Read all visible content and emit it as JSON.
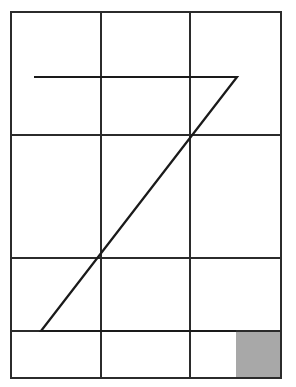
{
  "canvas": {
    "width": 296,
    "height": 387,
    "background_color": "#ffffff",
    "title": "Z-shaped polyline over a rectangular grid with a shaded corner cell"
  },
  "grid": {
    "name": "background-grid",
    "stroke_color": "#2b2b2b",
    "stroke_width": 1.6,
    "fill": "none",
    "outer_rect": {
      "x": 11,
      "y": 12,
      "width": 270,
      "height": 366
    },
    "vertical_lines_x": [
      101,
      190
    ],
    "horizontal_lines_y": [
      135,
      258,
      331
    ],
    "columns": 3,
    "rows": 4,
    "column_edges_x": [
      11,
      101,
      190,
      281
    ],
    "row_edges_y": [
      12,
      135,
      258,
      331,
      378
    ]
  },
  "z_shape": {
    "name": "z-polyline",
    "stroke_color": "#1a1a1a",
    "stroke_width": 2.2,
    "fill": "none",
    "closed": false,
    "points": [
      {
        "x": 34,
        "y": 77,
        "label": "top-left-start"
      },
      {
        "x": 237,
        "y": 77,
        "label": "top-right-vertex"
      },
      {
        "x": 41,
        "y": 331,
        "label": "bottom-left-vertex"
      },
      {
        "x": 236,
        "y": 331,
        "label": "bottom-right-end"
      }
    ],
    "polyline_points": "34,77 237,77 41,331 236,331",
    "diagonal_crossings": [
      {
        "x": 190,
        "y": 135,
        "note": "passes through grid intersection"
      },
      {
        "x": 101,
        "y": 258,
        "note": "passes through grid intersection"
      }
    ],
    "segments": [
      {
        "name": "top-horizontal-stroke",
        "from": "34,77",
        "to": "237,77"
      },
      {
        "name": "diagonal-stroke",
        "from": "237,77",
        "to": "41,331"
      },
      {
        "name": "bottom-horizontal-stroke",
        "from": "41,331",
        "to": "236,331"
      }
    ]
  },
  "shaded_cell": {
    "name": "gray-corner-square",
    "fill_color": "#a8a8a8",
    "stroke": "none",
    "x": 236,
    "y": 331,
    "width": 45,
    "height": 47,
    "position": "bottom-right"
  },
  "chart_data": {
    "type": "line",
    "xlabel": "",
    "ylabel": "",
    "xlim": [
      11,
      281
    ],
    "ylim": [
      12,
      378
    ],
    "grid": true,
    "legend": "none",
    "series": [
      {
        "name": "z-polyline",
        "x": [
          34,
          237,
          41,
          236
        ],
        "y": [
          77,
          77,
          331,
          331
        ]
      }
    ],
    "annotations": [
      {
        "name": "gray-corner-square",
        "x": 236,
        "y": 331,
        "width": 45,
        "height": 47,
        "color": "#a8a8a8"
      }
    ]
  }
}
